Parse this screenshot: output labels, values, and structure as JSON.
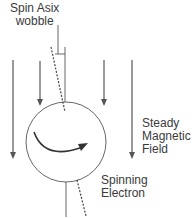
{
  "diagram": {
    "title": {
      "line1": "Spin Asix",
      "line2": "wobble"
    },
    "field_label": {
      "line1": "Steady",
      "line2": "Magnetic",
      "line3": "Field"
    },
    "electron_label": {
      "line1": "Spinning",
      "line2": "Electron"
    },
    "colors": {
      "stroke": "#555555",
      "text": "#3a3a3a",
      "background": "#ffffff"
    },
    "elements": [
      "field-arrow-left-long",
      "field-arrow-left-short",
      "field-arrow-right-short",
      "field-arrow-right-long",
      "electron-circle",
      "rotation-arrow",
      "spin-axis-solid",
      "spin-axis-tilted-dashed",
      "wobble-bracket"
    ]
  }
}
